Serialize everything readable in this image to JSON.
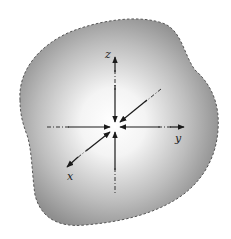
{
  "diagram": {
    "body": {
      "outline_style": "dashed",
      "fill_center_color": "#ffffff",
      "fill_edge_color": "#8f8f8f",
      "outline_color": "#555555"
    },
    "axes": [
      {
        "id": "z",
        "label": "z"
      },
      {
        "id": "y",
        "label": "y"
      },
      {
        "id": "x",
        "label": "x"
      }
    ],
    "stress_arrows": {
      "count": 6,
      "direction": "inward",
      "color": "#1a1a1a"
    }
  }
}
